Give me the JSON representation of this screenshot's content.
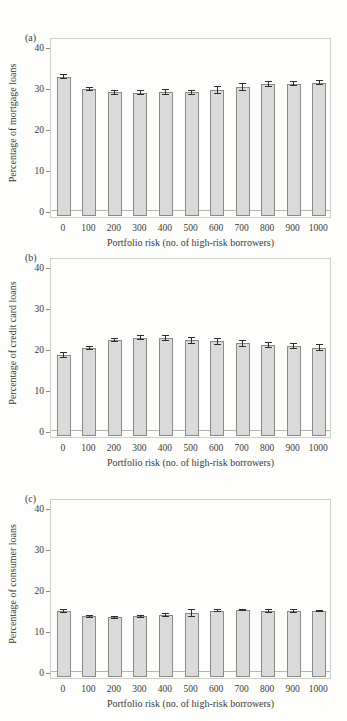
{
  "figure": {
    "yticks": [
      0,
      10,
      20,
      30,
      40
    ],
    "ylim": [
      0,
      40
    ],
    "bar_fill_color": "#dadada",
    "bar_border_color": "#8a8a86",
    "error_bar_color": "#2e2e2e",
    "plot_border_color": "#cfcfc9"
  },
  "chart_data": [
    {
      "type": "bar",
      "panel": "(a)",
      "ylabel": "Percentage of mortgage loans",
      "xlabel": "Portfolio risk (no. of high-risk borrowers)",
      "categories": [
        "0",
        "100",
        "200",
        "300",
        "400",
        "500",
        "600",
        "700",
        "800",
        "900",
        "1000"
      ],
      "values": [
        32.8,
        29.7,
        29.0,
        28.9,
        29.1,
        29.0,
        29.5,
        30.2,
        30.9,
        31.1,
        31.3
      ],
      "errors": [
        0.6,
        0.5,
        0.6,
        0.6,
        0.7,
        0.6,
        0.9,
        1.0,
        0.7,
        0.6,
        0.6
      ],
      "ylim": [
        0,
        40
      ],
      "yticks": [
        0,
        10,
        20,
        30,
        40
      ],
      "grid": false,
      "legend": "none"
    },
    {
      "type": "bar",
      "panel": "(b)",
      "ylabel": "Percentage of credit card loans",
      "xlabel": "Portfolio risk (no. of high-risk borrowers)",
      "categories": [
        "0",
        "100",
        "200",
        "300",
        "400",
        "500",
        "600",
        "700",
        "800",
        "900",
        "1000"
      ],
      "values": [
        18.5,
        20.2,
        22.2,
        22.7,
        22.6,
        22.1,
        21.9,
        21.4,
        21.0,
        20.7,
        20.3
      ],
      "errors": [
        0.8,
        0.5,
        0.5,
        0.6,
        0.7,
        0.9,
        0.8,
        0.8,
        0.7,
        0.8,
        0.9
      ],
      "ylim": [
        0,
        40
      ],
      "yticks": [
        0,
        10,
        20,
        30,
        40
      ],
      "grid": false,
      "legend": "none"
    },
    {
      "type": "bar",
      "panel": "(c)",
      "ylabel": "Percentage of consumer loans",
      "xlabel": "Portfolio risk (no. of high-risk borrowers)",
      "categories": [
        "0",
        "100",
        "200",
        "300",
        "400",
        "500",
        "600",
        "700",
        "800",
        "900",
        "1000"
      ],
      "values": [
        14.9,
        13.6,
        13.3,
        13.6,
        13.9,
        14.4,
        15.0,
        15.1,
        14.9,
        14.9,
        14.9
      ],
      "errors": [
        0.5,
        0.4,
        0.3,
        0.4,
        0.4,
        0.9,
        0.4,
        0.3,
        0.4,
        0.4,
        0.3
      ],
      "ylim": [
        0,
        40
      ],
      "yticks": [
        0,
        10,
        20,
        30,
        40
      ],
      "grid": false,
      "legend": "none"
    }
  ]
}
